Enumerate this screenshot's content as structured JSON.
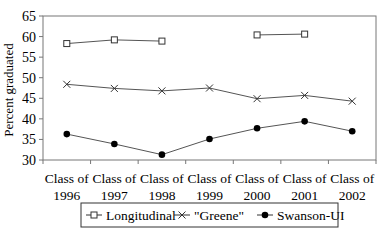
{
  "chart_data": {
    "type": "line",
    "title": "",
    "xlabel": "",
    "ylabel": "Percent graduated",
    "ylim": [
      30,
      65
    ],
    "yticks": [
      30,
      35,
      40,
      45,
      50,
      55,
      60,
      65
    ],
    "grid": false,
    "legend_position": "bottom",
    "categories": [
      "Class of 1996",
      "Class of 1997",
      "Class of 1998",
      "Class of 1999",
      "Class of 2000",
      "Class of 2001",
      "Class of 2002"
    ],
    "category_lines": [
      [
        "Class of",
        "1996"
      ],
      [
        "Class of",
        "1997"
      ],
      [
        "Class of",
        "1998"
      ],
      [
        "Class of",
        "1999"
      ],
      [
        "Class of",
        "2000"
      ],
      [
        "Class of",
        "2001"
      ],
      [
        "Class of",
        "2002"
      ]
    ],
    "series": [
      {
        "name": "Longitudinal",
        "marker": "square-open",
        "values": [
          58.3,
          59.2,
          58.9,
          null,
          60.4,
          60.6,
          null
        ]
      },
      {
        "name": "\"Greene\"",
        "marker": "x",
        "values": [
          48.4,
          47.4,
          46.8,
          47.5,
          44.9,
          45.7,
          44.3
        ]
      },
      {
        "name": "Swanson-UI",
        "marker": "circle-filled",
        "values": [
          36.3,
          33.9,
          31.3,
          35.1,
          37.7,
          39.4,
          37.0
        ]
      }
    ]
  },
  "colors": {
    "line": "#555555",
    "frame": "#777777",
    "marker": "#000000"
  }
}
